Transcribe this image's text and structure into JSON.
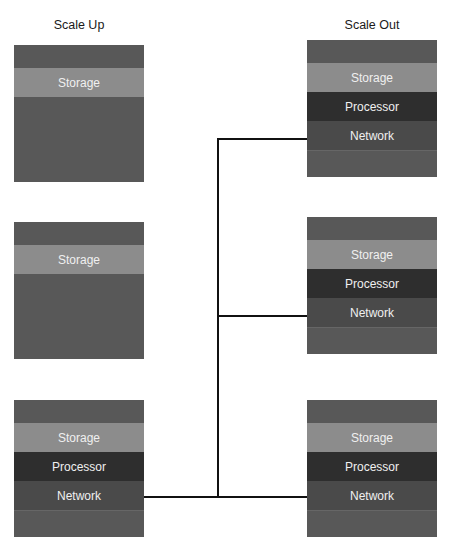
{
  "diagram": {
    "titles": {
      "left": "Scale Up",
      "right": "Scale Out"
    },
    "colors": {
      "frame": "#585858",
      "storage": "#8c8c8c",
      "processor": "#2e2e2e",
      "network": "#4a4a4a",
      "connector": "#111111"
    },
    "scale_up": [
      {
        "bands": [
          "Storage"
        ]
      },
      {
        "bands": [
          "Storage"
        ]
      },
      {
        "bands": [
          "Storage",
          "Processor",
          "Network"
        ]
      }
    ],
    "scale_out": [
      {
        "bands": [
          "Storage",
          "Processor",
          "Network"
        ]
      },
      {
        "bands": [
          "Storage",
          "Processor",
          "Network"
        ]
      },
      {
        "bands": [
          "Storage",
          "Processor",
          "Network"
        ]
      }
    ],
    "labels": {
      "storage": "Storage",
      "processor": "Processor",
      "network": "Network"
    }
  }
}
